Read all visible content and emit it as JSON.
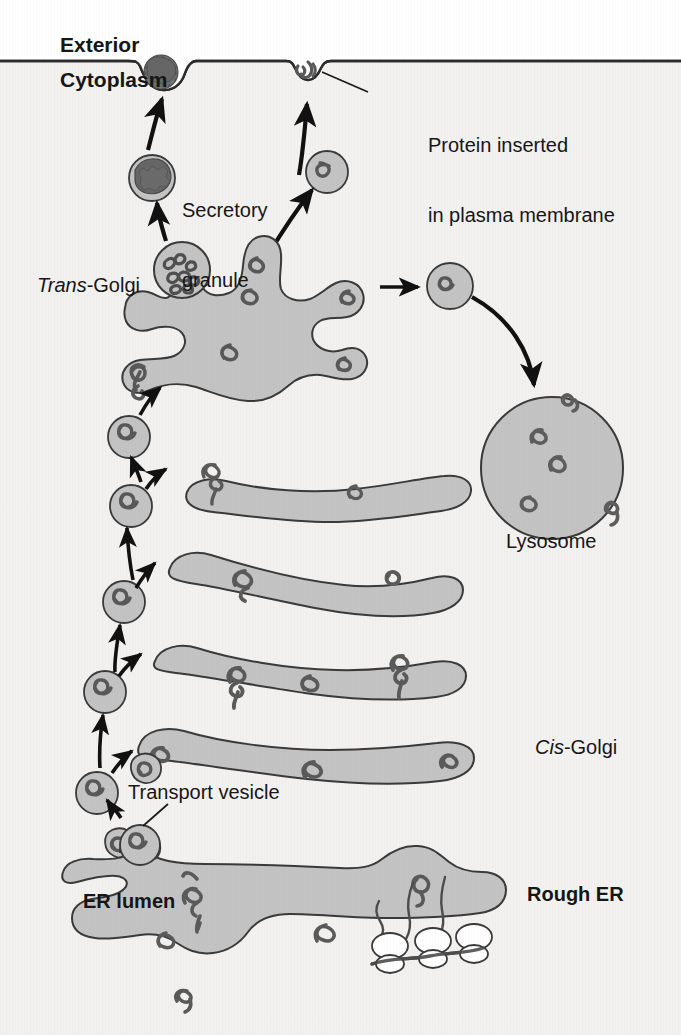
{
  "figure": {
    "background_color": "#f2f1ef",
    "exterior_color": "#ffffff",
    "organelle_fill": "#c3c3c3",
    "organelle_stroke": "#3a3a3a",
    "granule_fill": "#6e6e6e",
    "protein_squiggle_color": "#555555",
    "arrow_color": "#111111",
    "text_color": "#161616"
  },
  "labels": {
    "exterior": "Exterior",
    "cytoplasm": "Cytoplasm",
    "protein_inserted_line1": "Protein inserted",
    "protein_inserted_line2": "in plasma membrane",
    "secretory_granule_line1": "Secretory",
    "secretory_granule_line2": "granule",
    "trans_golgi_italic": "Trans",
    "trans_golgi_rest": "-Golgi",
    "lysosome": "Lysosome",
    "cis_golgi_italic": "Cis",
    "cis_golgi_rest": "-Golgi",
    "transport_vesicle": "Transport vesicle",
    "er_lumen": "ER lumen",
    "rough_er": "Rough ER"
  },
  "structures": {
    "plasma_membrane": {
      "name": "plasma membrane",
      "features": [
        "exocytosis pit with secretory granule",
        "inserted membrane protein"
      ]
    },
    "secretory_granule": {
      "name": "Secretory granule",
      "count": 2
    },
    "trans_golgi_network": {
      "name": "Trans-Golgi",
      "cargo_proteins": 6
    },
    "golgi_cisternae": {
      "name": "Golgi stack",
      "count": 4
    },
    "cis_golgi": {
      "name": "Cis-Golgi"
    },
    "lysosome": {
      "name": "Lysosome",
      "enzymes": 5
    },
    "rough_er": {
      "name": "Rough ER",
      "ribosomes": 3
    },
    "transport_vesicles": {
      "name": "Transport vesicle",
      "count": 8
    }
  }
}
